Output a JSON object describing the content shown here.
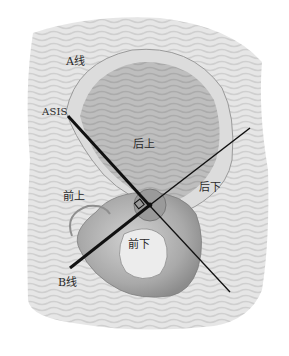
{
  "diagram": {
    "labels": {
      "a_line": "A线",
      "asis": "ASIS",
      "posterior_superior": "后上",
      "anterior_superior": "前上",
      "posterior_inferior": "后下",
      "anterior_inferior": "前下",
      "b_line": "B线"
    },
    "lines": {
      "a_line": {
        "from": [
          68,
          116
        ],
        "to": [
          150,
          206
        ],
        "weight": "thick"
      },
      "b_line": {
        "from": [
          70,
          268
        ],
        "to": [
          250,
          128
        ],
        "weight": "thick-to-thin"
      },
      "extension": {
        "from": [
          150,
          206
        ],
        "to": [
          230,
          292
        ],
        "weight": "thin"
      }
    },
    "intersection": [
      150,
      205
    ],
    "right_angle_marker": [
      140,
      205
    ],
    "colors": {
      "background": "#ffffff",
      "skin_light": "#e8e8e8",
      "skin_mid": "#c9c9c9",
      "bone": "#b8b8b8",
      "bone_dark": "#8a8a8a",
      "line": "#111111",
      "text": "#2a2a2a"
    }
  }
}
